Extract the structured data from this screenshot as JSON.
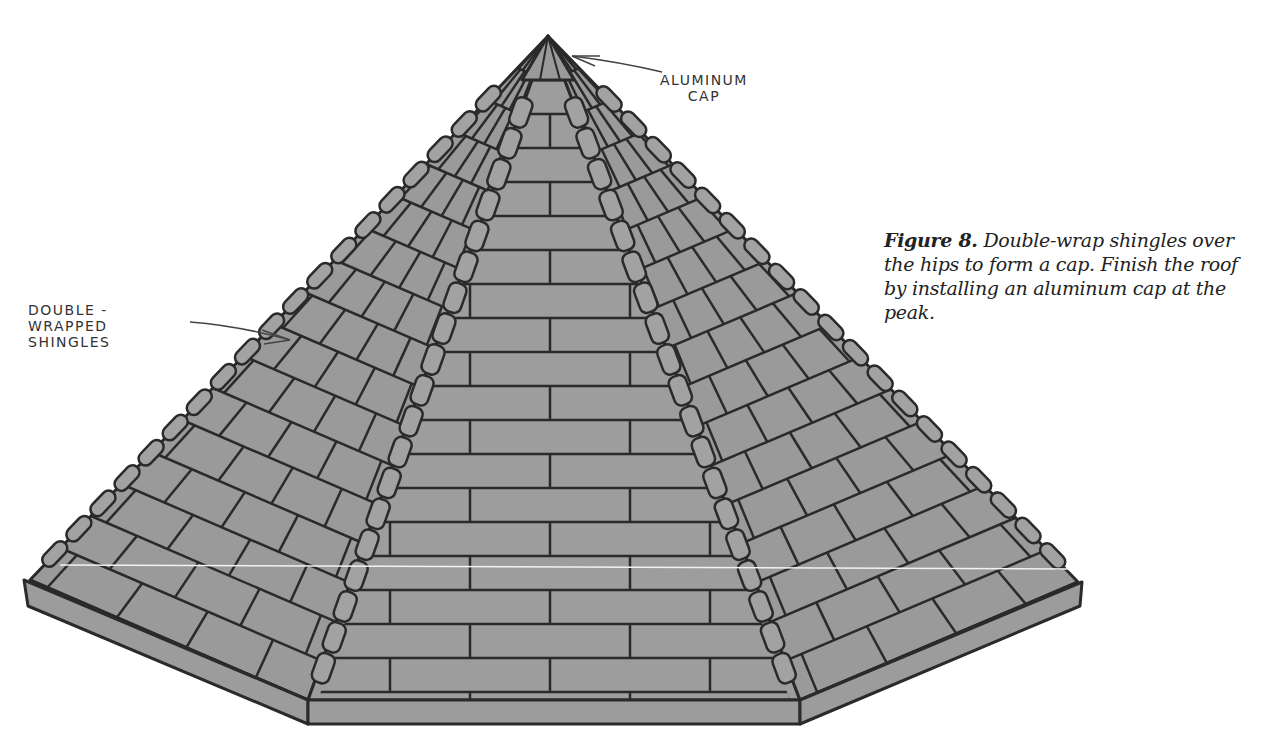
{
  "figure": {
    "callouts": {
      "aluminum_cap": {
        "line1": "ALUMINUM",
        "line2": "CAP"
      },
      "double_wrapped": {
        "line1": "DOUBLE -",
        "line2": "WRAPPED",
        "line3": "SHINGLES"
      }
    },
    "colors": {
      "shingle_fill": "#9a9a9a",
      "stroke": "#2a2a2a",
      "background": "#ffffff"
    }
  },
  "caption": {
    "lead": "Figure 8.",
    "text": " Double-wrap shingles over the hips to form a cap. Finish the roof by installing an aluminum cap at the peak."
  }
}
